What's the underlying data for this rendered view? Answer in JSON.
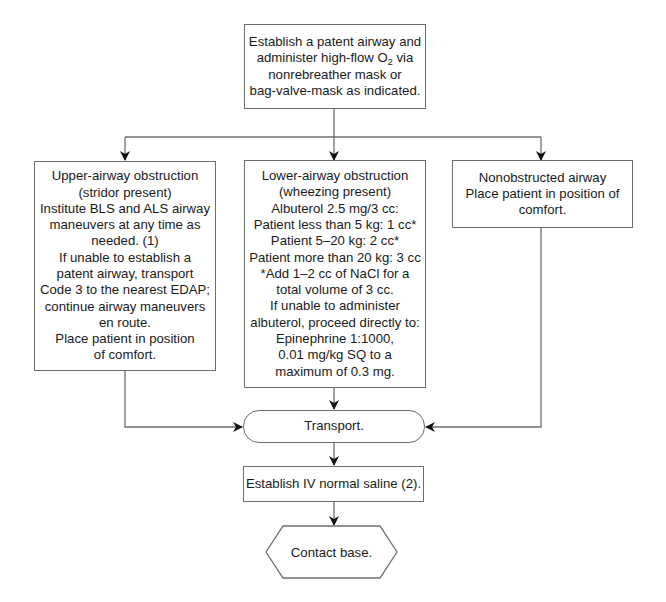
{
  "flowchart": {
    "start": {
      "lines": [
        "Establish a patent airway and",
        "administer high-flow O",
        "2",
        " via",
        "nonrebreather mask or",
        "bag-valve-mask as indicated."
      ]
    },
    "branches": [
      {
        "id": "upper",
        "lines": [
          "Upper-airway obstruction",
          "(stridor present)",
          "Institute BLS and ALS airway",
          "maneuvers at any time as",
          "needed. (1)",
          "If unable to establish a",
          "patent airway, transport",
          "Code 3 to the nearest EDAP;",
          "continue airway maneuvers",
          "en route.",
          "Place patient in position",
          "of comfort."
        ]
      },
      {
        "id": "lower",
        "lines": [
          "Lower-airway obstruction",
          "(wheezing present)",
          "Albuterol 2.5 mg/3 cc:",
          "Patient less than 5 kg: 1 cc*",
          "Patient 5–20 kg: 2 cc*",
          "Patient more than 20 kg: 3 cc",
          "*Add 1–2 cc of NaCl for a",
          "total volume of 3 cc.",
          "If unable to administer",
          "albuterol, proceed directly to:",
          "Epinephrine 1:1000,",
          "0.01 mg/kg SQ to a",
          "maximum of 0.3 mg."
        ]
      },
      {
        "id": "nonobstructed",
        "lines": [
          "Nonobstructed airway",
          "Place patient in position of",
          "comfort."
        ]
      }
    ],
    "transport": {
      "label": "Transport."
    },
    "iv": {
      "label": "Establish IV normal saline (2)."
    },
    "end": {
      "label": "Contact base."
    }
  },
  "colors": {
    "line": "#6e6e6e",
    "arrow": "#111111",
    "text": "#1a1a1a",
    "background": "#ffffff"
  }
}
